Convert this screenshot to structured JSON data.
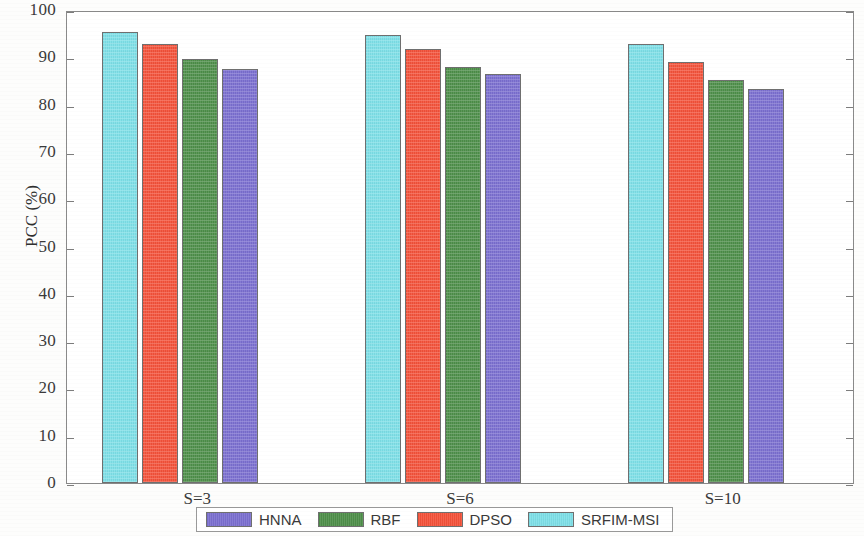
{
  "chart_data": {
    "type": "bar",
    "title": "",
    "subtitle": "",
    "xlabel": "",
    "ylabel": "PCC (%)",
    "categories": [
      "S=3",
      "S=6",
      "S=10"
    ],
    "series": [
      {
        "name": "HNNA",
        "color": "#7b6fd0",
        "values": [
          87.5,
          86.5,
          83.3
        ]
      },
      {
        "name": "RBF",
        "color": "#4e8f4a",
        "values": [
          89.6,
          88.0,
          85.2
        ]
      },
      {
        "name": "DPSO",
        "color": "#f4523a",
        "values": [
          92.8,
          91.8,
          89.0
        ]
      },
      {
        "name": "SRFIM-MSI",
        "color": "#7ee0e8",
        "values": [
          95.3,
          94.7,
          92.8
        ]
      }
    ],
    "bar_draw_order": [
      "SRFIM-MSI",
      "DPSO",
      "RBF",
      "HNNA"
    ],
    "ylim": [
      0,
      100
    ],
    "ytick_step": 10,
    "ytick_labels": [
      "0",
      "10",
      "20",
      "30",
      "40",
      "50",
      "60",
      "70",
      "80",
      "90",
      "100"
    ],
    "ytick_values": [
      0,
      10,
      20,
      30,
      40,
      50,
      60,
      70,
      80,
      90,
      100
    ],
    "grid": false,
    "legend_position": "bottom-outside",
    "legend_order": [
      "HNNA",
      "RBF",
      "DPSO",
      "SRFIM-MSI"
    ],
    "axis_box": true
  },
  "legend": {
    "entries": [
      {
        "label": "HNNA",
        "color": "#7b6fd0"
      },
      {
        "label": "RBF",
        "color": "#4e8f4a"
      },
      {
        "label": "DPSO",
        "color": "#f4523a"
      },
      {
        "label": "SRFIM-MSI",
        "color": "#7ee0e8"
      }
    ]
  },
  "axes": {
    "y_label": "PCC (%)",
    "y_ticks": [
      "100",
      "90",
      "80",
      "70",
      "60",
      "50",
      "40",
      "30",
      "20",
      "10",
      "0"
    ],
    "x_ticks": [
      "S=3",
      "S=6",
      "S=10"
    ]
  }
}
